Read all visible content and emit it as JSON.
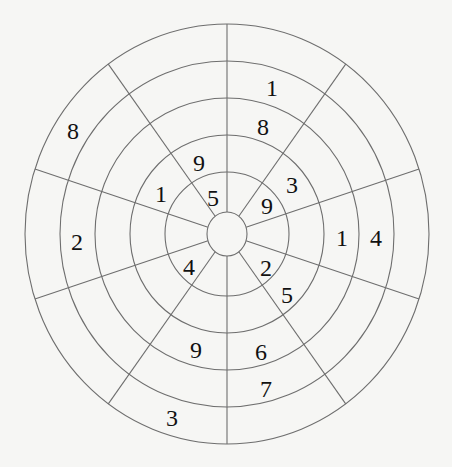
{
  "puzzle": {
    "type": "circular number wheel",
    "sectors": 10,
    "rings": 5,
    "center": {
      "x": 227,
      "y": 234
    },
    "hub_radius": {
      "rx": 20,
      "ry": 22
    },
    "ring_radii": [
      {
        "rx": 62,
        "ry": 62
      },
      {
        "rx": 97,
        "ry": 99
      },
      {
        "rx": 132,
        "ry": 136
      },
      {
        "rx": 167,
        "ry": 173
      },
      {
        "rx": 202,
        "ry": 210
      }
    ],
    "line_color": "#6e6e6e",
    "number_color": "#111111",
    "background": "#f6f6f4",
    "numbers": [
      {
        "value": "1",
        "x": 272,
        "y": 88
      },
      {
        "value": "8",
        "x": 263,
        "y": 127
      },
      {
        "value": "3",
        "x": 292,
        "y": 185
      },
      {
        "value": "9",
        "x": 267,
        "y": 206
      },
      {
        "value": "1",
        "x": 342,
        "y": 238
      },
      {
        "value": "4",
        "x": 376,
        "y": 238
      },
      {
        "value": "2",
        "x": 266,
        "y": 268
      },
      {
        "value": "5",
        "x": 287,
        "y": 295
      },
      {
        "value": "6",
        "x": 261,
        "y": 352
      },
      {
        "value": "7",
        "x": 266,
        "y": 389
      },
      {
        "value": "3",
        "x": 172,
        "y": 418
      },
      {
        "value": "9",
        "x": 196,
        "y": 350
      },
      {
        "value": "4",
        "x": 189,
        "y": 267
      },
      {
        "value": "2",
        "x": 77,
        "y": 242
      },
      {
        "value": "1",
        "x": 161,
        "y": 194
      },
      {
        "value": "5",
        "x": 213,
        "y": 198
      },
      {
        "value": "9",
        "x": 199,
        "y": 163
      },
      {
        "value": "8",
        "x": 73,
        "y": 131
      }
    ]
  }
}
